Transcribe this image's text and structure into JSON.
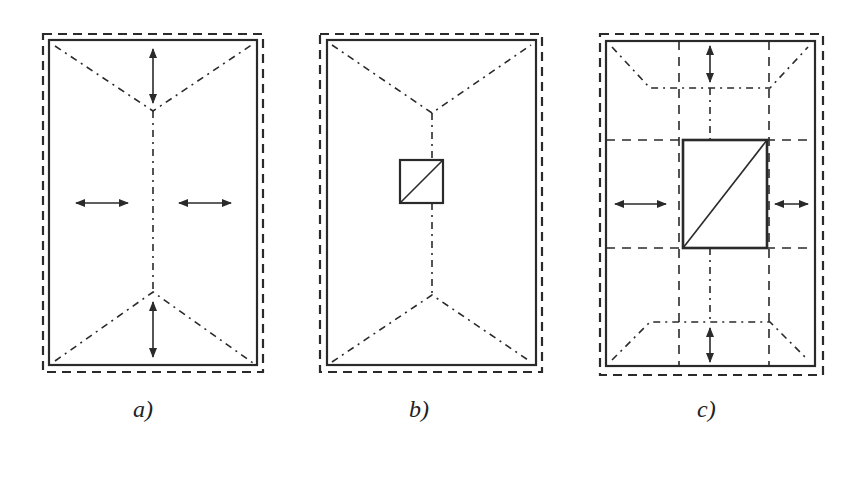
{
  "figure": {
    "panels": [
      {
        "id": "a",
        "label": "a)",
        "description": "Rectangular slab with hip ridge lines, no opening; four double-headed arrows"
      },
      {
        "id": "b",
        "label": "b)",
        "description": "Rectangular slab with hip ridge lines and small square opening with diagonal"
      },
      {
        "id": "c",
        "label": "c)",
        "description": "Rectangular slab with large rectangular opening with diagonal, dashed grid strips and four double-headed arrows"
      }
    ]
  },
  "colors": {
    "line": "#2a2a2a",
    "background": "#ffffff"
  }
}
